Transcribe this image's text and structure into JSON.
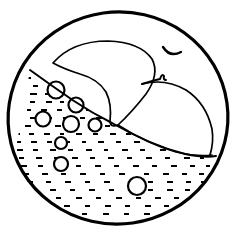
{
  "artwork": {
    "title": "Sleeping sea creature in circular frame",
    "style": "black-and-white line drawing",
    "background_color": "#ffffff",
    "ink_color": "#000000"
  },
  "frame": {
    "shape": "circle",
    "center_x": 118,
    "center_y": 118,
    "radius_x": 110,
    "radius_y": 106,
    "rotation_deg": -8,
    "stroke_width": 3.2
  },
  "creature": {
    "name": "sleeping-whale",
    "eye": {
      "name": "closed-eye",
      "path": "M 163 47 Q 170 58 181 52",
      "stroke_width": 2.4
    },
    "snout_notch": {
      "name": "snout-notch",
      "path": "M 142 84 Q 155 80 160 79 Q 162 73 164 76 Q 163 80 166 80",
      "stroke_width": 2.0
    },
    "body_outline": {
      "name": "body-outline",
      "path": "M 53 63 Q 72 41 108 41 Q 140 42 152 59 Q 160 74 146 94 Q 132 112 118 125 Q 110 128 110 121 Q 112 104 106 92 Q 98 79 80 74 Q 64 69 53 63 Z",
      "stroke_width": 1.7
    },
    "lower_fin": {
      "name": "lower-fin",
      "path": "M 142 84 Q 165 78 186 90 Q 206 103 212 129 Q 214 142 210 155",
      "stroke_width": 1.7
    },
    "tail_line": {
      "name": "tail-edge-line",
      "path": "M 118 125 Q 146 143 176 152 Q 198 157 212 155",
      "stroke_width": 1.7
    }
  },
  "water": {
    "name": "water-region",
    "surface_path": "M 30 70 Q 52 86 74 101 Q 92 113 112 123 Q 150 145 185 154 Q 205 158 216 156",
    "stroke_width": 2.0,
    "dash_rows": [
      {
        "y": 78,
        "dashes": [
          {
            "x": 24,
            "w": 7
          },
          {
            "x": 42,
            "w": 6
          }
        ]
      },
      {
        "y": 86,
        "dashes": [
          {
            "x": 20,
            "w": 7
          },
          {
            "x": 33,
            "w": 5
          },
          {
            "x": 52,
            "w": 6
          }
        ]
      },
      {
        "y": 94,
        "dashes": [
          {
            "x": 17,
            "w": 6
          },
          {
            "x": 30,
            "w": 7
          },
          {
            "x": 45,
            "w": 5
          },
          {
            "x": 62,
            "w": 6
          }
        ]
      },
      {
        "y": 102,
        "dashes": [
          {
            "x": 15,
            "w": 7
          },
          {
            "x": 30,
            "w": 5
          },
          {
            "x": 46,
            "w": 6
          },
          {
            "x": 60,
            "w": 4
          },
          {
            "x": 74,
            "w": 6
          }
        ]
      },
      {
        "y": 110,
        "dashes": [
          {
            "x": 14,
            "w": 6
          },
          {
            "x": 27,
            "w": 4
          },
          {
            "x": 41,
            "w": 6
          },
          {
            "x": 57,
            "w": 5
          },
          {
            "x": 73,
            "w": 6
          },
          {
            "x": 86,
            "w": 5
          }
        ]
      },
      {
        "y": 118,
        "dashes": [
          {
            "x": 13,
            "w": 7
          },
          {
            "x": 30,
            "w": 5
          },
          {
            "x": 48,
            "w": 4
          },
          {
            "x": 63,
            "w": 6
          },
          {
            "x": 80,
            "w": 5
          },
          {
            "x": 96,
            "w": 6
          }
        ]
      },
      {
        "y": 126,
        "dashes": [
          {
            "x": 13,
            "w": 5
          },
          {
            "x": 25,
            "w": 6
          },
          {
            "x": 40,
            "w": 4
          },
          {
            "x": 55,
            "w": 6
          },
          {
            "x": 72,
            "w": 5
          },
          {
            "x": 90,
            "w": 6
          },
          {
            "x": 105,
            "w": 5
          }
        ]
      },
      {
        "y": 134,
        "dashes": [
          {
            "x": 14,
            "w": 6
          },
          {
            "x": 29,
            "w": 5
          },
          {
            "x": 44,
            "w": 6
          },
          {
            "x": 60,
            "w": 4
          },
          {
            "x": 76,
            "w": 6
          },
          {
            "x": 93,
            "w": 5
          },
          {
            "x": 110,
            "w": 6
          },
          {
            "x": 126,
            "w": 5
          }
        ]
      },
      {
        "y": 142,
        "dashes": [
          {
            "x": 16,
            "w": 5
          },
          {
            "x": 31,
            "w": 6
          },
          {
            "x": 47,
            "w": 5
          },
          {
            "x": 64,
            "w": 6
          },
          {
            "x": 82,
            "w": 4
          },
          {
            "x": 98,
            "w": 6
          },
          {
            "x": 116,
            "w": 5
          },
          {
            "x": 134,
            "w": 6
          },
          {
            "x": 152,
            "w": 5
          }
        ]
      },
      {
        "y": 150,
        "dashes": [
          {
            "x": 17,
            "w": 6
          },
          {
            "x": 33,
            "w": 5
          },
          {
            "x": 50,
            "w": 6
          },
          {
            "x": 68,
            "w": 5
          },
          {
            "x": 86,
            "w": 6
          },
          {
            "x": 104,
            "w": 4
          },
          {
            "x": 122,
            "w": 6
          },
          {
            "x": 140,
            "w": 5
          },
          {
            "x": 160,
            "w": 6
          },
          {
            "x": 178,
            "w": 5
          }
        ]
      },
      {
        "y": 158,
        "dashes": [
          {
            "x": 19,
            "w": 5
          },
          {
            "x": 36,
            "w": 6
          },
          {
            "x": 54,
            "w": 5
          },
          {
            "x": 72,
            "w": 6
          },
          {
            "x": 90,
            "w": 5
          },
          {
            "x": 108,
            "w": 6
          },
          {
            "x": 127,
            "w": 5
          },
          {
            "x": 146,
            "w": 6
          },
          {
            "x": 165,
            "w": 5
          },
          {
            "x": 184,
            "w": 6
          },
          {
            "x": 200,
            "w": 4
          }
        ]
      },
      {
        "y": 166,
        "dashes": [
          {
            "x": 21,
            "w": 6
          },
          {
            "x": 38,
            "w": 5
          },
          {
            "x": 57,
            "w": 6
          },
          {
            "x": 76,
            "w": 5
          },
          {
            "x": 95,
            "w": 6
          },
          {
            "x": 114,
            "w": 5
          },
          {
            "x": 133,
            "w": 6
          },
          {
            "x": 152,
            "w": 5
          },
          {
            "x": 171,
            "w": 6
          },
          {
            "x": 190,
            "w": 5
          },
          {
            "x": 206,
            "w": 4
          }
        ]
      },
      {
        "y": 174,
        "dashes": [
          {
            "x": 24,
            "w": 5
          },
          {
            "x": 42,
            "w": 6
          },
          {
            "x": 61,
            "w": 5
          },
          {
            "x": 80,
            "w": 6
          },
          {
            "x": 100,
            "w": 5
          },
          {
            "x": 119,
            "w": 6
          },
          {
            "x": 144,
            "w": 5
          },
          {
            "x": 163,
            "w": 6
          },
          {
            "x": 182,
            "w": 5
          },
          {
            "x": 199,
            "w": 5
          }
        ]
      },
      {
        "y": 182,
        "dashes": [
          {
            "x": 27,
            "w": 6
          },
          {
            "x": 46,
            "w": 5
          },
          {
            "x": 65,
            "w": 6
          },
          {
            "x": 85,
            "w": 5
          },
          {
            "x": 104,
            "w": 6
          },
          {
            "x": 148,
            "w": 5
          },
          {
            "x": 167,
            "w": 6
          },
          {
            "x": 186,
            "w": 5
          },
          {
            "x": 201,
            "w": 4
          }
        ]
      },
      {
        "y": 190,
        "dashes": [
          {
            "x": 31,
            "w": 5
          },
          {
            "x": 50,
            "w": 6
          },
          {
            "x": 70,
            "w": 5
          },
          {
            "x": 89,
            "w": 6
          },
          {
            "x": 109,
            "w": 5
          },
          {
            "x": 128,
            "w": 6
          },
          {
            "x": 148,
            "w": 5
          },
          {
            "x": 167,
            "w": 6
          },
          {
            "x": 185,
            "w": 5
          },
          {
            "x": 199,
            "w": 4
          }
        ]
      },
      {
        "y": 198,
        "dashes": [
          {
            "x": 36,
            "w": 6
          },
          {
            "x": 56,
            "w": 5
          },
          {
            "x": 76,
            "w": 6
          },
          {
            "x": 96,
            "w": 5
          },
          {
            "x": 116,
            "w": 6
          },
          {
            "x": 136,
            "w": 5
          },
          {
            "x": 155,
            "w": 6
          },
          {
            "x": 174,
            "w": 5
          },
          {
            "x": 190,
            "w": 4
          }
        ]
      },
      {
        "y": 206,
        "dashes": [
          {
            "x": 44,
            "w": 5
          },
          {
            "x": 64,
            "w": 6
          },
          {
            "x": 85,
            "w": 5
          },
          {
            "x": 105,
            "w": 6
          },
          {
            "x": 125,
            "w": 5
          },
          {
            "x": 145,
            "w": 6
          },
          {
            "x": 164,
            "w": 5
          },
          {
            "x": 181,
            "w": 5
          }
        ]
      },
      {
        "y": 214,
        "dashes": [
          {
            "x": 60,
            "w": 6
          },
          {
            "x": 82,
            "w": 5
          },
          {
            "x": 103,
            "w": 6
          },
          {
            "x": 124,
            "w": 5
          },
          {
            "x": 144,
            "w": 6
          },
          {
            "x": 163,
            "w": 5
          }
        ]
      }
    ],
    "dash_stroke_width": 2.0,
    "bubbles": [
      {
        "name": "bubble-1",
        "cx": 56,
        "cy": 90,
        "r": 8.5,
        "stroke_width": 2.2
      },
      {
        "name": "bubble-2",
        "cx": 76,
        "cy": 105,
        "r": 7.5,
        "stroke_width": 2.2
      },
      {
        "name": "bubble-3",
        "cx": 43,
        "cy": 119,
        "r": 7.5,
        "stroke_width": 2.2
      },
      {
        "name": "bubble-4",
        "cx": 71,
        "cy": 124,
        "r": 8.0,
        "stroke_width": 2.2
      },
      {
        "name": "bubble-5",
        "cx": 95,
        "cy": 125,
        "r": 6.5,
        "stroke_width": 2.2
      },
      {
        "name": "bubble-6",
        "cx": 61,
        "cy": 143,
        "r": 6.0,
        "stroke_width": 2.2
      },
      {
        "name": "bubble-7",
        "cx": 61,
        "cy": 164,
        "r": 7.0,
        "stroke_width": 2.2
      },
      {
        "name": "bubble-8",
        "cx": 137,
        "cy": 186,
        "r": 9.0,
        "stroke_width": 2.2
      }
    ]
  }
}
